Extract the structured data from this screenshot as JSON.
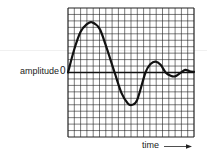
{
  "chart_data": {
    "type": "line",
    "title": "",
    "xlabel": "time",
    "ylabel": "amplitude",
    "y_tick_labels": [
      "0"
    ],
    "grid": true,
    "grid_columns": 20,
    "grid_rows": 20,
    "xlim": [
      0,
      20
    ],
    "ylim": [
      -10,
      10
    ],
    "x_axis_arrow": true,
    "series": [
      {
        "name": "damped oscillation",
        "x": [
          0,
          1,
          2,
          3,
          3.8,
          5,
          6,
          7.4,
          8.5,
          9.5,
          10.2,
          11,
          12.3,
          13.1,
          13.9,
          14.7,
          15.5,
          16.3,
          17,
          17.8,
          18.6,
          19.3,
          20
        ],
        "y": [
          0,
          3.6,
          6.3,
          7.5,
          7.8,
          6.8,
          4.2,
          0,
          -3.2,
          -4.8,
          -5.0,
          -4.2,
          0,
          1.3,
          1.7,
          1.2,
          0,
          -0.5,
          -0.6,
          -0.1,
          0.4,
          0.2,
          0.1
        ]
      }
    ],
    "legend": null
  },
  "labels": {
    "ylabel": "amplitude",
    "zero": "0",
    "xlabel": "time"
  },
  "colors": {
    "line": "#111111",
    "grid": "#222222",
    "background": "#ffffff"
  }
}
